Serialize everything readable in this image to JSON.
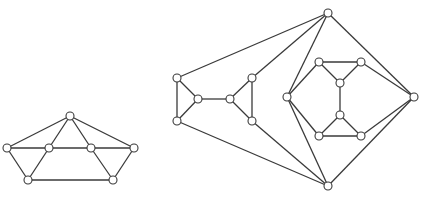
{
  "figure": {
    "background": "#ffffff",
    "stroke_color": "#3a3a3a",
    "node_fill": "#ffffff",
    "node_radius": 4
  },
  "graphs": [
    {
      "name": "left-graph",
      "nodes": [
        {
          "id": "p",
          "x": 70,
          "y": 116
        },
        {
          "id": "l",
          "x": 7,
          "y": 148
        },
        {
          "id": "m1",
          "x": 49,
          "y": 148
        },
        {
          "id": "m2",
          "x": 91,
          "y": 148
        },
        {
          "id": "r",
          "x": 134,
          "y": 148
        },
        {
          "id": "q1",
          "x": 28,
          "y": 180
        },
        {
          "id": "q2",
          "x": 113,
          "y": 180
        }
      ],
      "edges": [
        [
          "p",
          "l"
        ],
        [
          "p",
          "m1"
        ],
        [
          "p",
          "m2"
        ],
        [
          "p",
          "r"
        ],
        [
          "l",
          "m1"
        ],
        [
          "m1",
          "m2"
        ],
        [
          "m2",
          "r"
        ],
        [
          "l",
          "q1"
        ],
        [
          "m1",
          "q1"
        ],
        [
          "q1",
          "q2"
        ],
        [
          "m2",
          "q2"
        ],
        [
          "r",
          "q2"
        ]
      ]
    },
    {
      "name": "right-graph",
      "nodes": [
        {
          "id": "t",
          "x": 328,
          "y": 13
        },
        {
          "id": "u",
          "x": 328,
          "y": 186
        },
        {
          "id": "rr",
          "x": 414,
          "y": 97
        },
        {
          "id": "a",
          "x": 177,
          "y": 78
        },
        {
          "id": "b",
          "x": 177,
          "y": 121
        },
        {
          "id": "c",
          "x": 198,
          "y": 99
        },
        {
          "id": "d",
          "x": 230,
          "y": 99
        },
        {
          "id": "e",
          "x": 252,
          "y": 78
        },
        {
          "id": "f",
          "x": 252,
          "y": 121
        },
        {
          "id": "g",
          "x": 287,
          "y": 97
        },
        {
          "id": "h1",
          "x": 319,
          "y": 62
        },
        {
          "id": "h2",
          "x": 361,
          "y": 62
        },
        {
          "id": "i1",
          "x": 340,
          "y": 83
        },
        {
          "id": "i2",
          "x": 340,
          "y": 115
        },
        {
          "id": "j1",
          "x": 319,
          "y": 136
        },
        {
          "id": "j2",
          "x": 361,
          "y": 136
        }
      ],
      "edges": [
        [
          "a",
          "b"
        ],
        [
          "a",
          "c"
        ],
        [
          "b",
          "c"
        ],
        [
          "c",
          "d"
        ],
        [
          "d",
          "e"
        ],
        [
          "d",
          "f"
        ],
        [
          "e",
          "f"
        ],
        [
          "t",
          "a"
        ],
        [
          "t",
          "e"
        ],
        [
          "t",
          "g"
        ],
        [
          "t",
          "rr"
        ],
        [
          "u",
          "b"
        ],
        [
          "u",
          "f"
        ],
        [
          "u",
          "g"
        ],
        [
          "u",
          "rr"
        ],
        [
          "g",
          "h1"
        ],
        [
          "h1",
          "h2"
        ],
        [
          "h1",
          "i1"
        ],
        [
          "h2",
          "i1"
        ],
        [
          "h2",
          "rr"
        ],
        [
          "i1",
          "i2"
        ],
        [
          "i2",
          "j1"
        ],
        [
          "i2",
          "j2"
        ],
        [
          "j1",
          "j2"
        ],
        [
          "g",
          "j1"
        ],
        [
          "j2",
          "rr"
        ]
      ]
    }
  ]
}
